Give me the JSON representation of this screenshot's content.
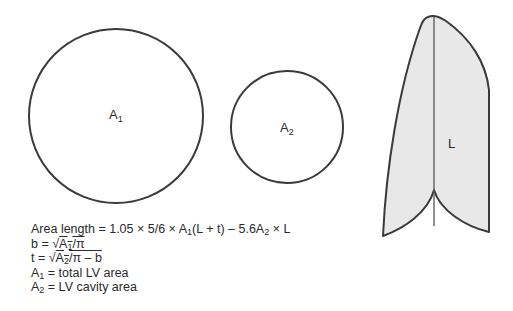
{
  "diagram": {
    "circle_large": {
      "label": "A",
      "subscript": "1"
    },
    "circle_small": {
      "label": "A",
      "subscript": "2"
    },
    "ventricle": {
      "label": "L",
      "fill": "#e6e6e6",
      "stroke": "#3a3a3a"
    }
  },
  "formulas": {
    "area_length": {
      "prefix": "Area length = 1.05 × 5/6 × A",
      "sub1": "1",
      "mid": "(L + t) – 5.6A",
      "sub2": "2",
      "suffix": " × L"
    },
    "b": {
      "prefix": "b = √",
      "a": "A",
      "sub": "1",
      "rest": "/π"
    },
    "t": {
      "prefix": "t = √",
      "a": "A",
      "sub": "2",
      "rest": "/π – b"
    },
    "a1_def": {
      "a": "A",
      "sub": "1",
      "rest": " = total LV area"
    },
    "a2_def": {
      "a": "A",
      "sub": "2",
      "rest": " = LV cavity area"
    }
  }
}
